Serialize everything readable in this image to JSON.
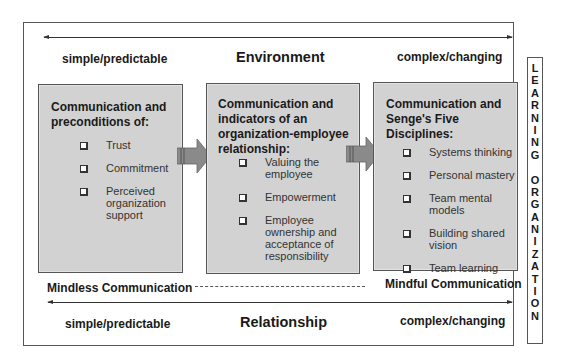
{
  "diagram": {
    "environment": {
      "title": "Environment",
      "left_label": "simple/predictable",
      "right_label": "complex/changing"
    },
    "relationship": {
      "title": "Relationship",
      "left_label": "simple/predictable",
      "right_label": "complex/changing"
    },
    "continuum": {
      "left_label": "Mindless Communication",
      "right_label": "Mindful Communication"
    },
    "boxes": [
      {
        "title": "Communication and preconditions of:",
        "title_lines": [
          "Communication and",
          "preconditions of:"
        ],
        "items": [
          {
            "lines": [
              "Trust"
            ]
          },
          {
            "lines": [
              "Commitment"
            ]
          },
          {
            "lines": [
              "Perceived",
              "organization",
              "support"
            ]
          }
        ]
      },
      {
        "title": "Communication and indicators of an organization-employee relationship:",
        "title_lines": [
          "Communication and",
          "indicators of an",
          "organization-employee",
          "relationship:"
        ],
        "items": [
          {
            "lines": [
              "Valuing the",
              "employee"
            ]
          },
          {
            "lines": [
              "Empowerment"
            ]
          },
          {
            "lines": [
              "Employee",
              "ownership and",
              "acceptance of",
              "responsibility"
            ]
          }
        ]
      },
      {
        "title": "Communication and Senge's Five Disciplines:",
        "title_lines": [
          "Communication and",
          "Senge's Five",
          "Disciplines:"
        ],
        "items": [
          {
            "lines": [
              "Systems thinking"
            ]
          },
          {
            "lines": [
              "Personal mastery"
            ]
          },
          {
            "lines": [
              "Team mental",
              "models"
            ]
          },
          {
            "lines": [
              "Building shared",
              "vision"
            ]
          },
          {
            "lines": [
              "Team learning"
            ]
          }
        ]
      }
    ],
    "side_label": {
      "text": "LEARNING ORGANIZATION",
      "letters": [
        "L",
        "E",
        "A",
        "R",
        "N",
        "I",
        "N",
        "G",
        " ",
        "O",
        "R",
        "G",
        "A",
        "N",
        "I",
        "Z",
        "A",
        "T",
        "I",
        "O",
        "N"
      ]
    },
    "icons": {
      "checkbox": "checkbox-bullet-icon",
      "flow_arrow": "right-block-arrow-icon"
    },
    "colors": {
      "box_fill": "#d2d2d2",
      "arrow_fill": "#8a8a8a",
      "line": "#333333"
    }
  }
}
